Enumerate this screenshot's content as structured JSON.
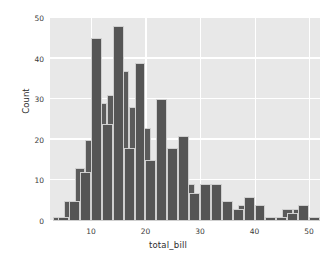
{
  "figure": {
    "background": "#ffffff",
    "plot_background": "#e8e8e8",
    "grid_color": "#ffffff",
    "bar_color": "#5b5b5b",
    "bar_edge_color": "#cfcfcf"
  },
  "axes": {
    "xlabel": "total_bill",
    "ylabel": "Count",
    "xticks": [
      "10",
      "20",
      "30",
      "40",
      "50"
    ],
    "yticks": [
      "0",
      "10",
      "20",
      "30",
      "40",
      "50"
    ]
  },
  "chart_data": {
    "type": "bar",
    "title": "",
    "xlabel": "total_bill",
    "ylabel": "Count",
    "xlim": [
      2.5,
      52
    ],
    "ylim": [
      0,
      50
    ],
    "grid": true,
    "legend": "none",
    "bin_width": 2,
    "series": [
      {
        "name": "series-a",
        "color": "#5b5b5b",
        "bin_edges": [
          3,
          5,
          7,
          9,
          11,
          13,
          15,
          17,
          19,
          21,
          23,
          25,
          27,
          29,
          31,
          33,
          35,
          37,
          39,
          41,
          43,
          45,
          47,
          49,
          51
        ],
        "bin_centers": [
          4,
          6,
          8,
          10,
          12,
          14,
          16,
          18,
          20,
          22,
          24,
          26,
          28,
          30,
          32,
          34,
          36,
          38,
          40,
          42,
          44,
          46,
          48,
          50
        ],
        "values": [
          1,
          5,
          13,
          20,
          29,
          31,
          37,
          28,
          23,
          13,
          13,
          10,
          9,
          5,
          7,
          2,
          2,
          4,
          1,
          1,
          1,
          3,
          3,
          1
        ]
      },
      {
        "name": "series-b",
        "color": "#555555",
        "bin_edges": [
          4,
          6,
          8,
          10,
          12,
          14,
          16,
          18,
          20,
          22,
          24,
          26,
          28,
          30,
          32,
          34,
          36,
          38,
          40,
          42,
          44,
          46,
          48,
          50,
          52
        ],
        "bin_centers": [
          5,
          7,
          9,
          11,
          13,
          15,
          17,
          19,
          21,
          23,
          25,
          27,
          29,
          31,
          33,
          35,
          37,
          39,
          41,
          43,
          45,
          47,
          49,
          51
        ],
        "values": [
          1,
          5,
          12,
          45,
          24,
          48,
          18,
          39,
          15,
          30,
          18,
          21,
          7,
          9,
          9,
          5,
          3,
          6,
          4,
          1,
          1,
          2,
          4,
          1
        ]
      }
    ]
  }
}
